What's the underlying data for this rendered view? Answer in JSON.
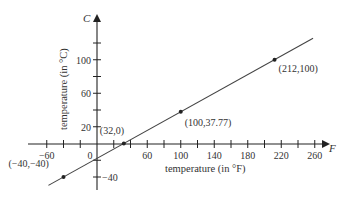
{
  "chart_data": {
    "type": "line",
    "title": "",
    "xlabel": "temperature (in °F)",
    "ylabel": "temperature (in °C)",
    "x_axis_letter": "F",
    "y_axis_letter": "C",
    "xlim": [
      -70,
      280
    ],
    "ylim": [
      -55,
      130
    ],
    "grid": false,
    "legend": null,
    "x_ticks": [
      -60,
      -40,
      -20,
      0,
      20,
      40,
      60,
      80,
      100,
      120,
      140,
      160,
      180,
      200,
      220,
      240,
      260
    ],
    "x_tick_labels": [
      "−60",
      "0",
      "60",
      "100",
      "140",
      "180",
      "220",
      "260"
    ],
    "x_tick_label_values": [
      -60,
      0,
      60,
      100,
      140,
      180,
      220,
      260
    ],
    "y_ticks": [
      -40,
      -20,
      20,
      40,
      60,
      80,
      100,
      120
    ],
    "y_tick_labels": [
      "20",
      "60",
      "100",
      "−40"
    ],
    "y_tick_label_values": [
      20,
      60,
      100,
      -40
    ],
    "series": [
      {
        "name": "C = 5/9 (F − 32)",
        "x": [
          -40,
          32,
          100,
          212
        ],
        "y": [
          -40,
          0,
          37.77,
          100
        ]
      }
    ],
    "annotations": [
      {
        "text": "(−40,−40)",
        "x": -40,
        "y": -40
      },
      {
        "text": "(32,0)",
        "x": 32,
        "y": 0
      },
      {
        "text": "(100,37.77)",
        "x": 100,
        "y": 37.77
      },
      {
        "text": "(212,100)",
        "x": 212,
        "y": 100
      }
    ],
    "colors": {
      "line": "#444444",
      "axis": "#222222",
      "text": "#333333"
    }
  }
}
